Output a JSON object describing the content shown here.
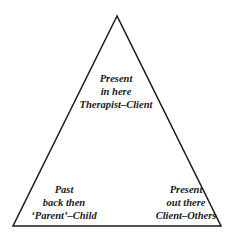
{
  "diagram": {
    "type": "triangle",
    "stroke_color": "#1a1a1a",
    "vertices": {
      "top": {
        "lines": [
          "Present",
          "in here",
          "Therapist–Client"
        ]
      },
      "bottom_left": {
        "lines": [
          "Past",
          "back then",
          "‘Parent’–Child"
        ]
      },
      "bottom_right": {
        "lines": [
          "Present",
          "out there",
          "Client–Others"
        ]
      }
    }
  }
}
